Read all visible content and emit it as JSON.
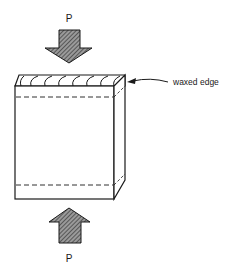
{
  "diagram": {
    "type": "edge-crush test schematic",
    "labels": {
      "load_top": "P",
      "load_bottom": "P",
      "callout": "waxed edge"
    },
    "elements": [
      {
        "name": "top-load-arrow",
        "direction": "down",
        "fill": "hatched"
      },
      {
        "name": "corrugated-specimen",
        "features": [
          "corrugated flutes on top edge",
          "dashed lines near top and bottom",
          "waxed edge strip"
        ]
      },
      {
        "name": "bottom-load-arrow",
        "direction": "up",
        "fill": "hatched"
      }
    ],
    "colors": {
      "line": "#1a1a1a",
      "arrow_fill": "#8a8a8a",
      "background": "#ffffff"
    }
  }
}
